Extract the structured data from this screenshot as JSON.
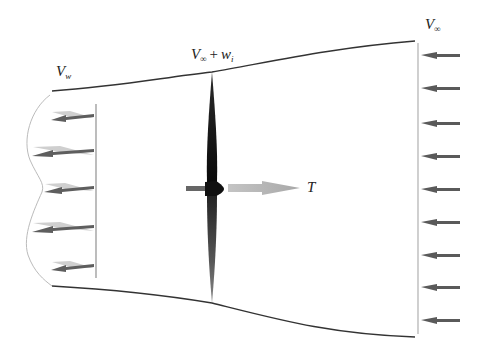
{
  "diagram": {
    "labels": {
      "freestream": {
        "main": "V",
        "sub": "∞"
      },
      "disk_velocity": {
        "main": "V",
        "sub": "∞",
        "op": "+",
        "term_main": "w",
        "term_sub": "i"
      },
      "wake": {
        "main": "V",
        "sub": "w"
      },
      "thrust": "T"
    },
    "freestream_arrows": {
      "count": 9,
      "x_tail": 461,
      "x_head": 418,
      "y": [
        55,
        87,
        122,
        156,
        189,
        222,
        255,
        287,
        320
      ]
    },
    "wake_arrows": {
      "count": 5,
      "x_tail": 94,
      "y": [
        117,
        151,
        187,
        227,
        265
      ]
    },
    "colors": {
      "stream_line": "#333333",
      "arrow": "#5a5a5a",
      "arrow_light": "#c8c8c8",
      "blade": "#111111",
      "thrust_arrow": "#b4b4b4",
      "plane": "#a8a8a8",
      "wake_profile": "#bbbbbb"
    }
  }
}
